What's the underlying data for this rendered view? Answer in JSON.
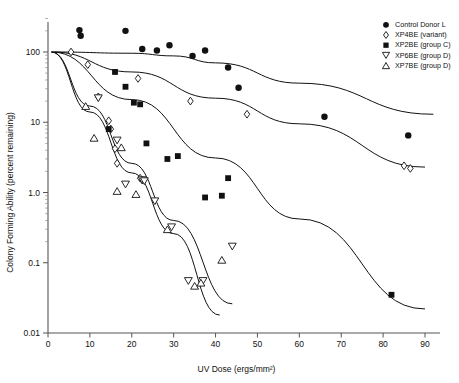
{
  "chart_data": {
    "type": "scatter",
    "title": "",
    "xlabel": "UV Dose (ergs/mm²)",
    "ylabel": "Colony Forming Ability (percent remaining)",
    "xlim": [
      0,
      92
    ],
    "ylim": [
      0.01,
      300
    ],
    "yscale": "log",
    "xticks": [
      0,
      10,
      20,
      30,
      40,
      50,
      60,
      70,
      80,
      90
    ],
    "xticklabels": [
      "0",
      "10",
      "20",
      "30",
      "40",
      "50",
      "60",
      "70",
      "80",
      "90"
    ],
    "yticks": [
      100,
      10,
      1.0,
      0.1,
      0.01
    ],
    "yticklabels": [
      "100",
      "10",
      "1.0",
      "0.1",
      "0.01"
    ],
    "grid": false,
    "legend_position": "top-right",
    "series": [
      {
        "name": "Control Donor L",
        "marker": "filled-circle",
        "legend_label": "Control Donor L",
        "points": [
          {
            "x": 7.5,
            "y": 205
          },
          {
            "x": 7.8,
            "y": 170
          },
          {
            "x": 18.5,
            "y": 200
          },
          {
            "x": 22.5,
            "y": 110
          },
          {
            "x": 26.0,
            "y": 105
          },
          {
            "x": 29.0,
            "y": 125
          },
          {
            "x": 34.5,
            "y": 88
          },
          {
            "x": 37.5,
            "y": 105
          },
          {
            "x": 43.0,
            "y": 60
          },
          {
            "x": 45.5,
            "y": 31
          },
          {
            "x": 66.0,
            "y": 12
          },
          {
            "x": 86.0,
            "y": 6.5
          }
        ]
      },
      {
        "name": "XP4BE (variant)",
        "marker": "open-diamond",
        "legend_label": "XP4BE (variant)",
        "points": [
          {
            "x": 5.5,
            "y": 100
          },
          {
            "x": 9.5,
            "y": 66
          },
          {
            "x": 12.0,
            "y": 23
          },
          {
            "x": 14.5,
            "y": 10.5
          },
          {
            "x": 15.0,
            "y": 8.0
          },
          {
            "x": 16.0,
            "y": 4.2
          },
          {
            "x": 16.5,
            "y": 2.6
          },
          {
            "x": 21.5,
            "y": 42
          },
          {
            "x": 22.0,
            "y": 1.6
          },
          {
            "x": 22.5,
            "y": 1.5
          },
          {
            "x": 34.0,
            "y": 20
          },
          {
            "x": 47.5,
            "y": 13
          },
          {
            "x": 85.0,
            "y": 2.4
          },
          {
            "x": 86.5,
            "y": 2.2
          }
        ]
      },
      {
        "name": "XP2BE (group C)",
        "marker": "filled-square",
        "legend_label": "XP2BE (group C)",
        "points": [
          {
            "x": 16.0,
            "y": 52
          },
          {
            "x": 18.5,
            "y": 32
          },
          {
            "x": 14.5,
            "y": 8.0
          },
          {
            "x": 20.5,
            "y": 19
          },
          {
            "x": 22.0,
            "y": 18
          },
          {
            "x": 23.5,
            "y": 5.0
          },
          {
            "x": 28.5,
            "y": 3.0
          },
          {
            "x": 31.0,
            "y": 3.3
          },
          {
            "x": 37.5,
            "y": 0.85
          },
          {
            "x": 41.5,
            "y": 0.9
          },
          {
            "x": 43.0,
            "y": 1.6
          },
          {
            "x": 82.0,
            "y": 0.035
          }
        ]
      },
      {
        "name": "XP6BE (group D)",
        "marker": "open-down-triangle",
        "legend_label": "XP6BE (group D)",
        "points": [
          {
            "x": 12.0,
            "y": 22
          },
          {
            "x": 16.5,
            "y": 5.5
          },
          {
            "x": 18.5,
            "y": 1.3
          },
          {
            "x": 22.5,
            "y": 1.5
          },
          {
            "x": 23.0,
            "y": 1.45
          },
          {
            "x": 25.5,
            "y": 0.75
          },
          {
            "x": 29.5,
            "y": 0.32
          },
          {
            "x": 37.0,
            "y": 0.055
          },
          {
            "x": 44.0,
            "y": 0.17
          },
          {
            "x": 33.5,
            "y": 0.055
          }
        ]
      },
      {
        "name": "XP7BE (group D)",
        "marker": "open-up-triangle",
        "legend_label": "XP7BE (group D)",
        "points": [
          {
            "x": 9.0,
            "y": 17
          },
          {
            "x": 11.0,
            "y": 6.0
          },
          {
            "x": 17.5,
            "y": 4.4
          },
          {
            "x": 16.5,
            "y": 1.05
          },
          {
            "x": 21.0,
            "y": 0.95
          },
          {
            "x": 28.5,
            "y": 0.3
          },
          {
            "x": 36.5,
            "y": 0.052
          },
          {
            "x": 41.5,
            "y": 0.11
          },
          {
            "x": 35.0,
            "y": 0.047
          }
        ]
      }
    ],
    "fit_lines": [
      {
        "name": "control-fit",
        "points": [
          [
            1.5,
            100
          ],
          [
            20,
            96
          ],
          [
            30,
            88
          ],
          [
            40,
            70
          ],
          [
            60,
            36
          ],
          [
            92,
            13
          ]
        ]
      },
      {
        "name": "xp4be-fit",
        "points": [
          [
            1.0,
            100
          ],
          [
            20,
            52
          ],
          [
            40,
            22
          ],
          [
            60,
            9.5
          ],
          [
            90,
            2.3
          ]
        ]
      },
      {
        "name": "xp2be-fit",
        "points": [
          [
            0.8,
            100
          ],
          [
            20,
            21
          ],
          [
            40,
            3.1
          ],
          [
            60,
            0.42
          ],
          [
            90,
            0.022
          ]
        ]
      },
      {
        "name": "xp6be-fit",
        "points": [
          [
            0.8,
            100
          ],
          [
            10,
            17
          ],
          [
            20,
            2.6
          ],
          [
            30,
            0.4
          ],
          [
            44,
            0.026
          ]
        ]
      },
      {
        "name": "xp7be-fit",
        "points": [
          [
            0.8,
            100
          ],
          [
            10,
            14
          ],
          [
            20,
            1.9
          ],
          [
            30,
            0.26
          ],
          [
            41,
            0.018
          ]
        ]
      }
    ]
  },
  "legend": {
    "items": [
      {
        "label": "Control Donor L",
        "marker": "filled-circle"
      },
      {
        "label": "XP4BE (variant)",
        "marker": "open-diamond"
      },
      {
        "label": "XP2BE (group C)",
        "marker": "filled-square"
      },
      {
        "label": "XP6BE (group D)",
        "marker": "open-down-triangle"
      },
      {
        "label": "XP7BE (group D)",
        "marker": "open-up-triangle"
      }
    ]
  },
  "colors": {
    "ink": "#111111",
    "axis": "#555555"
  }
}
